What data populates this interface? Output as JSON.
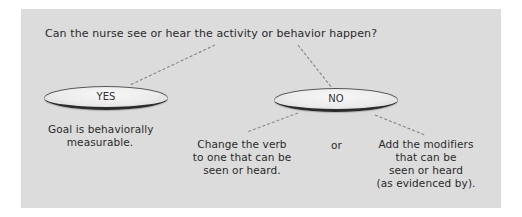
{
  "diagram": {
    "question": "Can the nurse see or hear the activity or behavior happen?",
    "yes_node": {
      "label": "YES",
      "outcome_line1": "Goal is behaviorally",
      "outcome_line2": "measurable."
    },
    "no_node": {
      "label": "NO",
      "option1": {
        "line1": "Change the verb",
        "line2": "to one that can be",
        "line3": "seen or heard."
      },
      "connector": "or",
      "option2": {
        "line1": "Add the modifiers",
        "line2": "that can be",
        "line3": "seen or heard",
        "line4": "(as evidenced by)."
      }
    },
    "colors": {
      "panel": "#dcdcdc",
      "line": "#8a8a8a",
      "oval_edge": "#2b2b2b"
    }
  }
}
